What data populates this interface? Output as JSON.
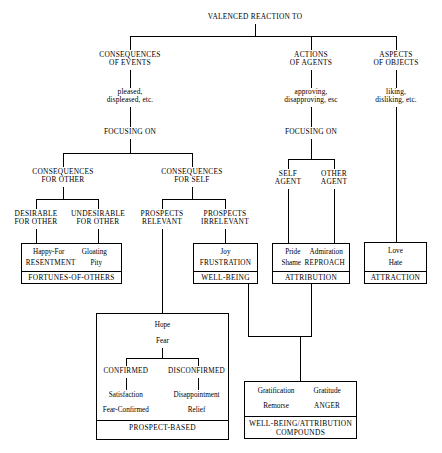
{
  "diagram": {
    "title": "VALENCED REACTION TO",
    "root": {
      "label": "VALENCED REACTION TO"
    },
    "branches": {
      "consequences_of_events": {
        "label": "CONSEQUENCES\nOF EVENTS",
        "appraisal": "pleased,\ndispleased, etc.",
        "focusing_on": "FOCUSING ON",
        "children": {
          "consequences_for_other": {
            "label": "CONSEQUENCES\nFOR OTHER",
            "children": [
              {
                "label": "DESIRABLE\nFOR OTHER"
              },
              {
                "label": "UNDESIRABLE\nFOR OTHER"
              }
            ]
          },
          "consequences_for_self": {
            "label": "CONSEQUENCES\nFOR SELF",
            "children": [
              {
                "label": "PROSPECTS\nRELEVANT"
              },
              {
                "label": "PROSPECTS\nIRRELEVANT"
              }
            ]
          }
        }
      },
      "actions_of_agents": {
        "label": "ACTIONS\nOF AGENTS",
        "appraisal": "approving,\ndisapproving, esc",
        "focusing_on": "FOCUSING ON",
        "children": [
          {
            "label": "SELF\nAGENT"
          },
          {
            "label": "OTHER\nAGENT"
          }
        ]
      },
      "aspects_of_objects": {
        "label": "ASPECTS\nOF OBJECTS",
        "appraisal": "liking,\ndisliking, etc."
      }
    },
    "groups": {
      "fortunes_of_others": {
        "name": "FORTUNES-OF-OTHERS",
        "emotions": [
          "Happy-For",
          "Gloating",
          "RESENTMENT",
          "Pity"
        ]
      },
      "well_being": {
        "name": "WELL-BEING",
        "emotions": [
          "Joy",
          "FRUSTRATION"
        ]
      },
      "attribution": {
        "name": "ATTRIBUTION",
        "emotions": [
          "Pride",
          "Admiration",
          "Shame",
          "REPROACH"
        ]
      },
      "attraction": {
        "name": "ATTRACTION",
        "emotions": [
          "Love",
          "Hate"
        ]
      },
      "prospect_based": {
        "name": "PROSPECT-BASED",
        "top_emotions": [
          "Hope",
          "Fear"
        ],
        "branches": [
          "CONFIRMED",
          "DISCONFIRMED"
        ],
        "emotions": [
          "Satisfaction",
          "Disappointment",
          "Fear-Confirmed",
          "Relief"
        ]
      },
      "compounds": {
        "name": "WELL-BEING/ATTRIBUTION\nCOMPOUNDS",
        "emotions": [
          "Gratification",
          "Gratitude",
          "Remorse",
          "ANGER"
        ]
      }
    }
  }
}
